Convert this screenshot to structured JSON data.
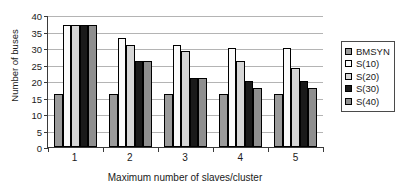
{
  "chart_data": {
    "type": "bar",
    "title": "",
    "xlabel": "Maximum number of slaves/cluster",
    "ylabel": "Number of buses",
    "categories": [
      "1",
      "2",
      "3",
      "4",
      "5"
    ],
    "ylim": [
      0,
      40
    ],
    "yticks": [
      0,
      5,
      10,
      15,
      20,
      25,
      30,
      35,
      40
    ],
    "grid": true,
    "legend_position": "right",
    "series": [
      {
        "name": "BMSYN",
        "color": "#9a9a9a",
        "values": [
          16,
          16,
          16,
          16,
          16
        ]
      },
      {
        "name": "S(10)",
        "color": "#fbfbfb",
        "values": [
          37,
          33,
          31,
          30,
          30
        ]
      },
      {
        "name": "S(20)",
        "color": "#d6d6d6",
        "values": [
          37,
          31,
          29,
          26,
          24
        ]
      },
      {
        "name": "S(30)",
        "color": "#1a1a1a",
        "values": [
          37,
          26,
          21,
          20,
          20
        ]
      },
      {
        "name": "S(40)",
        "color": "#8f8f8f",
        "values": [
          37,
          26,
          21,
          18,
          18
        ]
      }
    ]
  }
}
